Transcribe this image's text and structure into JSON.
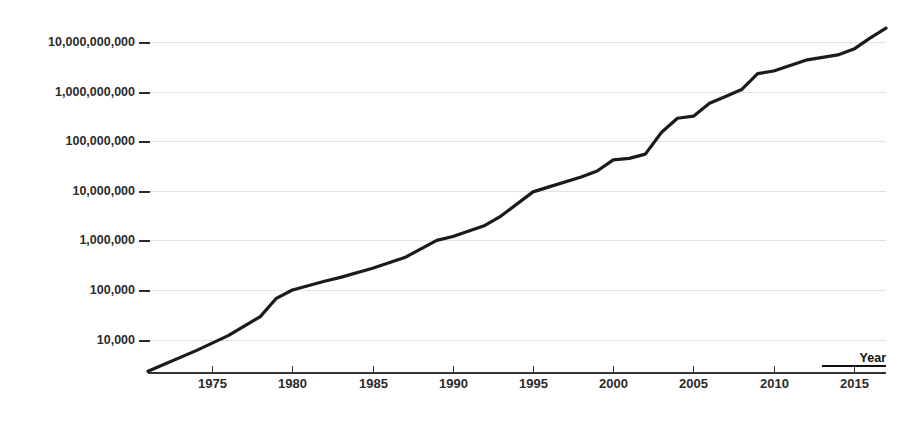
{
  "chart_data": {
    "type": "line",
    "title": "",
    "subtitle": "",
    "xlabel": "Year",
    "ylabel": "",
    "yscale": "log",
    "xscale": "linear",
    "grid": true,
    "legend": false,
    "legend_position": "none",
    "xlim": [
      1971,
      2017
    ],
    "ylim": [
      2000,
      30000000000
    ],
    "x_tick_labels": [
      "1975",
      "1980",
      "1985",
      "1990",
      "1995",
      "2000",
      "2005",
      "2010",
      "2015"
    ],
    "x_ticks": [
      1975,
      1980,
      1985,
      1990,
      1995,
      2000,
      2005,
      2010,
      2015
    ],
    "y_tick_labels": [
      "10,000,000,000",
      "1,000,000,000",
      "100,000,000",
      "10,000,000",
      "1,000,000",
      "100,000",
      "10,000"
    ],
    "y_ticks": [
      10000000000,
      1000000000,
      100000000,
      10000000,
      1000000,
      100000,
      10000
    ],
    "series": [
      {
        "name": "growth",
        "color": "#1b1b1b",
        "x": [
          1971,
          1974,
          1976,
          1978,
          1979,
          1980,
          1982,
          1983,
          1985,
          1987,
          1989,
          1990,
          1992,
          1993,
          1995,
          1996,
          1998,
          1999,
          2000,
          2001,
          2002,
          2003,
          2004,
          2005,
          2006,
          2007,
          2008,
          2009,
          2010,
          2012,
          2014,
          2015,
          2016,
          2017
        ],
        "y": [
          2300,
          6000,
          12000,
          29000,
          68000,
          100000,
          150000,
          180000,
          275000,
          450000,
          1000000,
          1200000,
          2000000,
          3100000,
          9500000,
          12000000,
          19000000,
          25000000,
          42000000,
          45000000,
          55000000,
          150000000,
          290000000,
          320000000,
          580000000,
          800000000,
          1100000000,
          2300000000,
          2600000000,
          4300000000,
          5500000000,
          7200000000,
          12000000000,
          19000000000
        ]
      }
    ],
    "annotations": []
  },
  "axis": {
    "x_axis_title": "Year"
  }
}
